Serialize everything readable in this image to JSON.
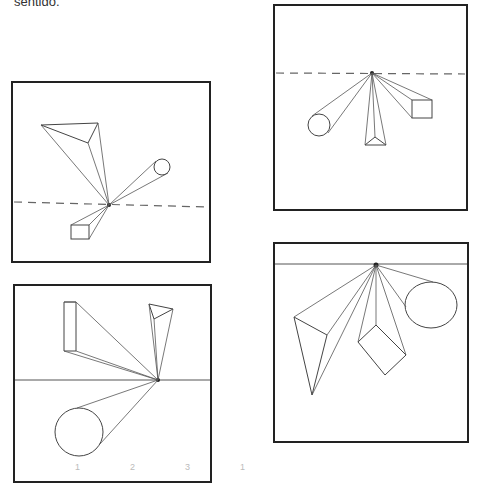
{
  "page": {
    "caption": "sentido."
  },
  "panels": [
    {
      "id": "top-left",
      "horizon": "dashed",
      "objects": [
        "triangular-prism",
        "cylinder",
        "rectangular-prism"
      ]
    },
    {
      "id": "top-right",
      "horizon": "dashed",
      "objects": [
        "cylinder",
        "triangular-prism",
        "rectangular-prism"
      ]
    },
    {
      "id": "bottom-left",
      "horizon": "solid",
      "objects": [
        "rectangular-prism",
        "triangular-prism",
        "cylinder"
      ]
    },
    {
      "id": "bottom-right",
      "horizon": "solid",
      "objects": [
        "triangular-prism",
        "cube",
        "cylinder"
      ]
    }
  ],
  "scan_marks": [
    "1",
    "2",
    "3",
    "1",
    "1"
  ]
}
